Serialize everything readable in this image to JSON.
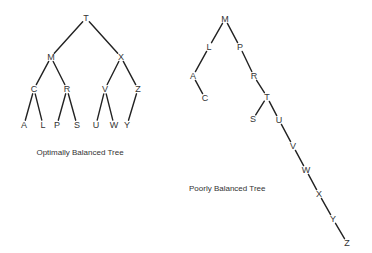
{
  "optimal_tree": {
    "caption": "Optimally Balanced Tree",
    "nodes": [
      {
        "id": "T",
        "x": 86,
        "y": 18
      },
      {
        "id": "M",
        "x": 51,
        "y": 57
      },
      {
        "id": "X",
        "x": 121,
        "y": 57
      },
      {
        "id": "C",
        "x": 34,
        "y": 89
      },
      {
        "id": "R",
        "x": 67,
        "y": 89
      },
      {
        "id": "V",
        "x": 105,
        "y": 89
      },
      {
        "id": "Z",
        "x": 138,
        "y": 89
      },
      {
        "id": "A",
        "x": 24,
        "y": 125
      },
      {
        "id": "L",
        "x": 43,
        "y": 125
      },
      {
        "id": "P",
        "x": 57,
        "y": 125
      },
      {
        "id": "S",
        "x": 77,
        "y": 125
      },
      {
        "id": "U",
        "x": 96,
        "y": 125
      },
      {
        "id": "W",
        "x": 114,
        "y": 125
      },
      {
        "id": "Y",
        "x": 127,
        "y": 125
      }
    ],
    "edges": [
      [
        "T",
        "M"
      ],
      [
        "T",
        "X"
      ],
      [
        "M",
        "C"
      ],
      [
        "M",
        "R"
      ],
      [
        "X",
        "V"
      ],
      [
        "X",
        "Z"
      ],
      [
        "C",
        "A"
      ],
      [
        "C",
        "L"
      ],
      [
        "R",
        "P"
      ],
      [
        "R",
        "S"
      ],
      [
        "V",
        "U"
      ],
      [
        "V",
        "W"
      ],
      [
        "Z",
        "Y"
      ]
    ]
  },
  "poor_tree": {
    "caption": "Poorly Balanced Tree",
    "nodes": [
      {
        "id": "M",
        "x": 225,
        "y": 19
      },
      {
        "id": "L",
        "x": 209,
        "y": 47
      },
      {
        "id": "P",
        "x": 240,
        "y": 47
      },
      {
        "id": "A",
        "x": 193,
        "y": 76
      },
      {
        "id": "C",
        "x": 205,
        "y": 98
      },
      {
        "id": "R",
        "x": 254,
        "y": 76
      },
      {
        "id": "T",
        "x": 267,
        "y": 97
      },
      {
        "id": "S",
        "x": 253,
        "y": 119
      },
      {
        "id": "U",
        "x": 279,
        "y": 120
      },
      {
        "id": "V",
        "x": 293,
        "y": 146
      },
      {
        "id": "W",
        "x": 306,
        "y": 170
      },
      {
        "id": "X",
        "x": 319,
        "y": 194
      },
      {
        "id": "Y",
        "x": 333,
        "y": 219
      },
      {
        "id": "Z",
        "x": 347,
        "y": 243
      }
    ],
    "edges": [
      [
        "M",
        "L"
      ],
      [
        "M",
        "P"
      ],
      [
        "L",
        "A"
      ],
      [
        "A",
        "C"
      ],
      [
        "P",
        "R"
      ],
      [
        "R",
        "T"
      ],
      [
        "T",
        "S"
      ],
      [
        "T",
        "U"
      ],
      [
        "U",
        "V"
      ],
      [
        "V",
        "W"
      ],
      [
        "W",
        "X"
      ],
      [
        "X",
        "Y"
      ],
      [
        "Y",
        "Z"
      ]
    ]
  }
}
